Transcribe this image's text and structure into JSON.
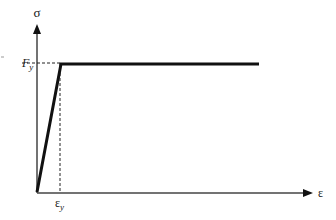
{
  "diagram": {
    "y_axis_label": "σ",
    "x_axis_label": "ε",
    "yield_stress_label": "F",
    "yield_stress_sub": "y",
    "yield_strain_label": "ε",
    "yield_strain_sub": "y",
    "colors": {
      "line": "#111111",
      "axis": "#333333"
    }
  }
}
